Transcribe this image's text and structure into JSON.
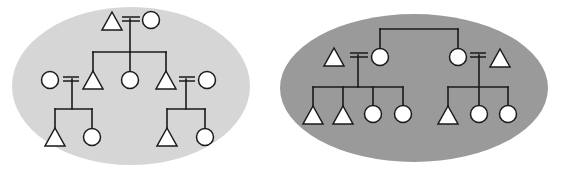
{
  "colors": {
    "background": "#ffffff",
    "left_ellipse_fill": "#d6d6d6",
    "right_ellipse_fill": "#9a9a9a",
    "symbol_fill": "#ffffff",
    "stroke": "#1a1a1a"
  },
  "legend": {
    "triangle": "male",
    "circle": "female",
    "double_line": "marriage"
  },
  "diagrams": [
    {
      "id": "left-kinship",
      "ellipse": {
        "cx": 131,
        "cy": 86,
        "rx": 119,
        "ry": 79
      },
      "description": "Three-generation kinship diagram: couple with three children (male, female, male); each son marries and has a son and daughter",
      "symbols": [
        {
          "shape": "triangle",
          "x": 112,
          "y": 21,
          "role": "grandfather"
        },
        {
          "shape": "circle",
          "x": 151,
          "y": 20,
          "role": "grandmother"
        },
        {
          "shape": "circle",
          "x": 50,
          "y": 80,
          "role": "wife-of-son-1"
        },
        {
          "shape": "triangle",
          "x": 93,
          "y": 80,
          "role": "son-1"
        },
        {
          "shape": "circle",
          "x": 130,
          "y": 80,
          "role": "daughter"
        },
        {
          "shape": "triangle",
          "x": 166,
          "y": 80,
          "role": "son-2"
        },
        {
          "shape": "circle",
          "x": 207,
          "y": 80,
          "role": "wife-of-son-2"
        },
        {
          "shape": "triangle",
          "x": 55,
          "y": 137,
          "role": "grandson-1"
        },
        {
          "shape": "circle",
          "x": 92,
          "y": 137,
          "role": "granddaughter-1"
        },
        {
          "shape": "triangle",
          "x": 167,
          "y": 137,
          "role": "grandson-2"
        },
        {
          "shape": "circle",
          "x": 205,
          "y": 137,
          "role": "granddaughter-2"
        }
      ],
      "marriages": [
        {
          "x1": 122,
          "x2": 140,
          "y": 19
        },
        {
          "x1": 63,
          "x2": 79,
          "y": 79
        },
        {
          "x1": 179,
          "x2": 195,
          "y": 79
        }
      ],
      "lines": [
        {
          "x1": 130,
          "y1": 19,
          "x2": 130,
          "y2": 52
        },
        {
          "x1": 93,
          "y1": 52,
          "x2": 166,
          "y2": 52
        },
        {
          "x1": 93,
          "y1": 52,
          "x2": 93,
          "y2": 71
        },
        {
          "x1": 130,
          "y1": 52,
          "x2": 130,
          "y2": 72
        },
        {
          "x1": 166,
          "y1": 52,
          "x2": 166,
          "y2": 71
        },
        {
          "x1": 72,
          "y1": 79,
          "x2": 72,
          "y2": 109
        },
        {
          "x1": 55,
          "y1": 109,
          "x2": 92,
          "y2": 109
        },
        {
          "x1": 55,
          "y1": 109,
          "x2": 55,
          "y2": 128
        },
        {
          "x1": 92,
          "y1": 109,
          "x2": 92,
          "y2": 129
        },
        {
          "x1": 186,
          "y1": 79,
          "x2": 186,
          "y2": 109
        },
        {
          "x1": 167,
          "y1": 109,
          "x2": 205,
          "y2": 109
        },
        {
          "x1": 167,
          "y1": 109,
          "x2": 167,
          "y2": 128
        },
        {
          "x1": 205,
          "y1": 109,
          "x2": 205,
          "y2": 129
        }
      ]
    },
    {
      "id": "right-kinship",
      "ellipse": {
        "cx": 414,
        "cy": 88,
        "rx": 134,
        "ry": 74
      },
      "description": "Two sisters each married; first couple has two sons and two daughters, second couple has one son and two daughters",
      "symbols": [
        {
          "shape": "triangle",
          "x": 334,
          "y": 57,
          "role": "husband-1"
        },
        {
          "shape": "circle",
          "x": 380,
          "y": 57,
          "role": "sister-1"
        },
        {
          "shape": "circle",
          "x": 458,
          "y": 57,
          "role": "sister-2"
        },
        {
          "shape": "triangle",
          "x": 500,
          "y": 58,
          "role": "husband-2"
        },
        {
          "shape": "triangle",
          "x": 313,
          "y": 115,
          "role": "son"
        },
        {
          "shape": "triangle",
          "x": 343,
          "y": 115,
          "role": "son"
        },
        {
          "shape": "circle",
          "x": 373,
          "y": 114,
          "role": "daughter"
        },
        {
          "shape": "circle",
          "x": 403,
          "y": 114,
          "role": "daughter"
        },
        {
          "shape": "triangle",
          "x": 448,
          "y": 115,
          "role": "son"
        },
        {
          "shape": "circle",
          "x": 479,
          "y": 114,
          "role": "daughter"
        },
        {
          "shape": "circle",
          "x": 508,
          "y": 114,
          "role": "daughter"
        }
      ],
      "marriages": [
        {
          "x1": 350,
          "x2": 368,
          "y": 55
        },
        {
          "x1": 470,
          "x2": 486,
          "y": 55
        }
      ],
      "lines": [
        {
          "x1": 380,
          "y1": 29,
          "x2": 458,
          "y2": 29
        },
        {
          "x1": 380,
          "y1": 29,
          "x2": 380,
          "y2": 49
        },
        {
          "x1": 458,
          "y1": 29,
          "x2": 458,
          "y2": 49
        },
        {
          "x1": 358,
          "y1": 55,
          "x2": 358,
          "y2": 87
        },
        {
          "x1": 313,
          "y1": 87,
          "x2": 403,
          "y2": 87
        },
        {
          "x1": 313,
          "y1": 87,
          "x2": 313,
          "y2": 106
        },
        {
          "x1": 343,
          "y1": 87,
          "x2": 343,
          "y2": 106
        },
        {
          "x1": 373,
          "y1": 87,
          "x2": 373,
          "y2": 106
        },
        {
          "x1": 403,
          "y1": 87,
          "x2": 403,
          "y2": 106
        },
        {
          "x1": 479,
          "y1": 55,
          "x2": 479,
          "y2": 106
        },
        {
          "x1": 448,
          "y1": 87,
          "x2": 508,
          "y2": 87
        },
        {
          "x1": 448,
          "y1": 87,
          "x2": 448,
          "y2": 106
        },
        {
          "x1": 508,
          "y1": 87,
          "x2": 508,
          "y2": 106
        }
      ]
    }
  ]
}
